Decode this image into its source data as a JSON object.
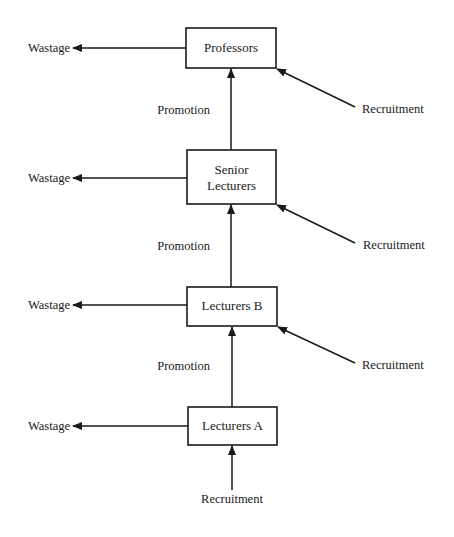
{
  "diagram": {
    "type": "flow-diagram",
    "colors": {
      "ink": "#1a1a1a",
      "background": "#ffffff"
    },
    "nodes": [
      {
        "id": "professors",
        "lines": [
          "Professors"
        ]
      },
      {
        "id": "senior_lecturers",
        "lines": [
          "Senior",
          "Lecturers"
        ]
      },
      {
        "id": "lecturers_b",
        "lines": [
          "Lecturers B"
        ]
      },
      {
        "id": "lecturers_a",
        "lines": [
          "Lecturers A"
        ]
      }
    ],
    "labels": {
      "wastage": [
        "Wastage",
        "Wastage",
        "Wastage",
        "Wastage"
      ],
      "promotion": [
        "Promotion",
        "Promotion",
        "Promotion"
      ],
      "recruitment": [
        "Recruitment",
        "Recruitment",
        "Recruitment",
        "Recruitment"
      ]
    },
    "edges": [
      {
        "from": "professors",
        "to": "wastage",
        "label": "Wastage"
      },
      {
        "from": "senior_lecturers",
        "to": "professors",
        "label": "Promotion"
      },
      {
        "from": "recruitment",
        "to": "professors",
        "label": "Recruitment"
      },
      {
        "from": "senior_lecturers",
        "to": "wastage",
        "label": "Wastage"
      },
      {
        "from": "lecturers_b",
        "to": "senior_lecturers",
        "label": "Promotion"
      },
      {
        "from": "recruitment",
        "to": "senior_lecturers",
        "label": "Recruitment"
      },
      {
        "from": "lecturers_b",
        "to": "wastage",
        "label": "Wastage"
      },
      {
        "from": "lecturers_a",
        "to": "lecturers_b",
        "label": "Promotion"
      },
      {
        "from": "recruitment",
        "to": "lecturers_b",
        "label": "Recruitment"
      },
      {
        "from": "lecturers_a",
        "to": "wastage",
        "label": "Wastage"
      },
      {
        "from": "recruitment",
        "to": "lecturers_a",
        "label": "Recruitment"
      }
    ]
  }
}
